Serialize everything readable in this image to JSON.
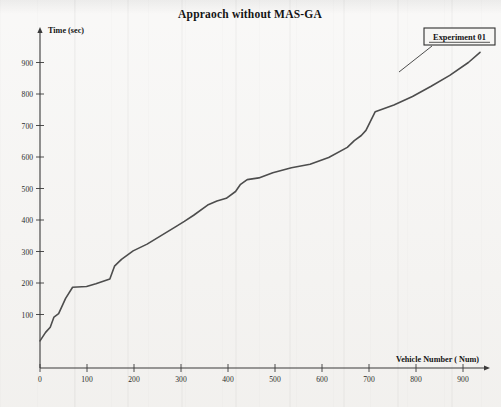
{
  "figure": {
    "title": "Appraoch without MAS-GA",
    "legend_label": "Experiment 01"
  },
  "chart_data": {
    "type": "line",
    "title": "Appraoch without MAS-GA",
    "xlabel": "Vehicle Number ( Num)",
    "ylabel": "Time (sec)",
    "xlim": [
      0,
      960
    ],
    "ylim": [
      0,
      960
    ],
    "xticks": [
      0,
      100,
      200,
      300,
      400,
      500,
      600,
      700,
      800,
      900
    ],
    "yticks": [
      100,
      200,
      300,
      400,
      500,
      600,
      700,
      800,
      900
    ],
    "grid": false,
    "legend_position": "top-right",
    "legend_entries": [
      "Experiment 01"
    ],
    "series": [
      {
        "name": "Experiment 01",
        "color": "#4d4d4d",
        "x": [
          0,
          12,
          22,
          30,
          40,
          55,
          70,
          100,
          120,
          150,
          160,
          175,
          200,
          230,
          260,
          290,
          310,
          330,
          360,
          380,
          400,
          420,
          430,
          445,
          470,
          500,
          540,
          580,
          620,
          660,
          675,
          690,
          700,
          720,
          760,
          800,
          840,
          880,
          920,
          945
        ],
        "y": [
          80,
          105,
          120,
          150,
          160,
          205,
          238,
          240,
          248,
          262,
          300,
          320,
          345,
          365,
          390,
          415,
          432,
          450,
          480,
          492,
          500,
          520,
          540,
          555,
          560,
          575,
          590,
          600,
          620,
          650,
          670,
          685,
          700,
          755,
          775,
          800,
          830,
          862,
          900,
          930
        ]
      }
    ]
  },
  "colors": {
    "line": "#4d4d4d",
    "axis": "#3a3a3a",
    "text": "#1a1a1a",
    "paper": "#f2f1ef"
  }
}
